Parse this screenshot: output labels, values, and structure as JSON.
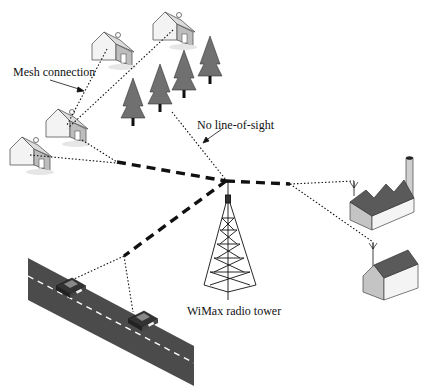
{
  "diagram": {
    "labels": {
      "mesh": "Mesh connection",
      "nlos": "No line-of-sight",
      "tower": "WiMax radio tower"
    },
    "nodes": [
      {
        "id": "tower",
        "type": "radio-tower"
      },
      {
        "id": "house-top-right",
        "type": "house"
      },
      {
        "id": "house-top-left",
        "type": "house"
      },
      {
        "id": "house-mid",
        "type": "house"
      },
      {
        "id": "house-bottom-left",
        "type": "house"
      },
      {
        "id": "trees",
        "type": "forest",
        "count": 6
      },
      {
        "id": "factory",
        "type": "factory-with-antenna"
      },
      {
        "id": "building",
        "type": "building-with-antenna"
      },
      {
        "id": "road",
        "type": "road"
      },
      {
        "id": "car-1",
        "type": "car"
      },
      {
        "id": "car-2",
        "type": "car"
      }
    ],
    "links": {
      "wimax": "bold dashed",
      "mesh": "dotted"
    },
    "colors": {
      "link": "#111111",
      "road": "#4a4a4a",
      "tree": "#6e6e6e",
      "roof_dark": "#555555",
      "wall_light": "#f2f2f2",
      "wall_shade": "#c8c8c8"
    }
  }
}
